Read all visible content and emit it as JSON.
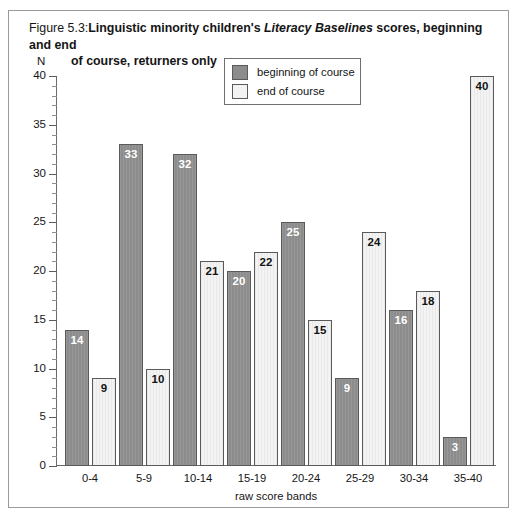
{
  "figure": {
    "number_prefix": "Figure 5.3:",
    "title_part1": "Linguistic minority children's ",
    "title_italic": "Literacy Baselines",
    "title_part2": " scores, beginning and end",
    "title_line2": "of course, returners only"
  },
  "legend": {
    "position": "inside-top-center",
    "entries": [
      {
        "label": "beginning of course",
        "color": "#8c8c8c"
      },
      {
        "label": "end of course",
        "color": "#f3f3f3"
      }
    ]
  },
  "axes": {
    "y_name": "N",
    "x_name": "raw score bands",
    "y_ticks": [
      "0",
      "5",
      "10",
      "15",
      "20",
      "25",
      "30",
      "35",
      "40"
    ]
  },
  "chart_data": {
    "type": "bar",
    "xlabel": "raw score bands",
    "ylabel": "N",
    "ylim": [
      0,
      40
    ],
    "ytick_step": 5,
    "minor_tick_step": 1,
    "grid": false,
    "legend_position": "inside-top-center",
    "categories": [
      "0-4",
      "5-9",
      "10-14",
      "15-19",
      "20-24",
      "25-29",
      "30-34",
      "35-40"
    ],
    "series": [
      {
        "name": "beginning of course",
        "color": "#8c8c8c",
        "values": [
          14,
          33,
          32,
          20,
          25,
          9,
          16,
          3
        ]
      },
      {
        "name": "end of course",
        "color": "#f3f3f3",
        "values": [
          9,
          10,
          21,
          22,
          15,
          24,
          18,
          40
        ]
      }
    ]
  }
}
